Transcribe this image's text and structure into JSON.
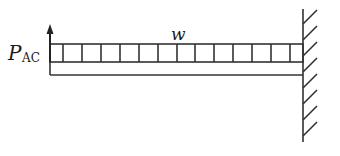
{
  "diagram": {
    "type": "cantilever-beam",
    "labels": {
      "load": "w",
      "force_main": "P",
      "force_sub": "AC"
    },
    "colors": {
      "stroke": "#333333",
      "background": "#ffffff"
    },
    "load_divisions": 13,
    "hatch_count": 8
  }
}
